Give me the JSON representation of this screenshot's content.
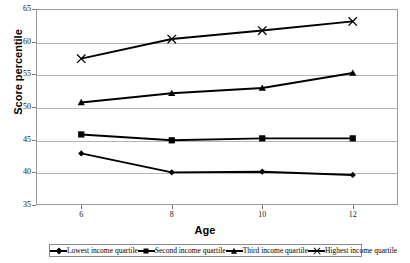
{
  "chart_data": {
    "type": "line",
    "title": "",
    "xlabel": "Age",
    "ylabel": "Score percentile",
    "categories": [
      6,
      8,
      10,
      12
    ],
    "x": [
      6,
      8,
      10,
      12
    ],
    "xlim": [
      5,
      13
    ],
    "ylim": [
      35,
      65
    ],
    "yticks": [
      35,
      40,
      45,
      50,
      55,
      60,
      65
    ],
    "xticks": [
      6,
      8,
      10,
      12
    ],
    "grid": "horizontal",
    "legend_position": "bottom",
    "series": [
      {
        "name": "Lowest income quartile",
        "marker": "diamond",
        "color": "#000000",
        "values": [
          42.9,
          40.0,
          40.1,
          39.6
        ]
      },
      {
        "name": "Second income quartile",
        "marker": "square",
        "color": "#000000",
        "values": [
          45.8,
          44.9,
          45.2,
          45.2
        ]
      },
      {
        "name": "Third income quartile",
        "marker": "triangle",
        "color": "#000000",
        "values": [
          50.7,
          52.1,
          52.9,
          55.2
        ]
      },
      {
        "name": "Highest income quartile",
        "marker": "cross",
        "color": "#000000",
        "values": [
          57.4,
          60.4,
          61.7,
          63.1
        ]
      }
    ]
  },
  "axes": {
    "y_tick_labels": [
      "65",
      "60",
      "55",
      "50",
      "45",
      "40",
      "35"
    ],
    "x_tick_labels": [
      "6",
      "8",
      "10",
      "12"
    ],
    "y_axis_title": "Score percentile",
    "x_axis_title": "Age"
  },
  "legend": {
    "items": [
      {
        "label": "Lowest income quartile",
        "marker": "diamond-marker-icon"
      },
      {
        "label": "Second income quartile",
        "marker": "square-marker-icon"
      },
      {
        "label": "Third income quartile",
        "marker": "triangle-marker-icon"
      },
      {
        "label": "Highest income quartile",
        "marker": "cross-marker-icon"
      }
    ]
  }
}
